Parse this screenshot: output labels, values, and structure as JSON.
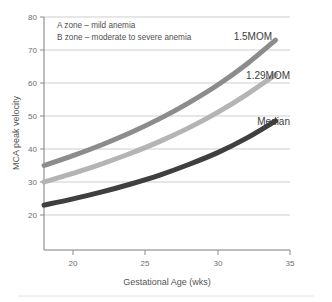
{
  "chart_data": {
    "type": "line",
    "title": "",
    "xlabel": "Gestational Age (wks)",
    "ylabel": "MCA peak velocity",
    "xlim": [
      18,
      35
    ],
    "ylim": [
      15,
      80
    ],
    "xticks": [
      20,
      25,
      30,
      35
    ],
    "yticks": [
      20,
      30,
      40,
      50,
      60,
      70,
      80
    ],
    "grid": true,
    "legend": "inline-right-labels",
    "x": [
      18,
      20,
      22,
      24,
      26,
      28,
      30,
      32,
      34
    ],
    "series": [
      {
        "name": "1.5MOM",
        "color": "#8c8c8c",
        "values": [
          35.0,
          38.0,
          41.3,
          45.0,
          49.2,
          54.0,
          59.4,
          65.7,
          73.0
        ]
      },
      {
        "name": "1.29MOM",
        "color": "#b4b4b4",
        "values": [
          30.0,
          32.6,
          35.5,
          38.7,
          42.3,
          46.4,
          51.1,
          56.5,
          62.5
        ]
      },
      {
        "name": "Median",
        "color": "#3f3f3f",
        "values": [
          23.0,
          24.9,
          27.0,
          29.4,
          32.1,
          35.3,
          38.9,
          43.3,
          48.5
        ]
      }
    ],
    "annotations": [
      "A zone – mild anemia",
      "B zone – moderate to severe anemia"
    ]
  },
  "axis": {
    "x_tick_labels": [
      "20",
      "25",
      "30",
      "35"
    ],
    "y_tick_labels": [
      "20",
      "30",
      "40",
      "50",
      "60",
      "70",
      "80"
    ]
  },
  "colors": {
    "grid": "#b9b9b9",
    "spine": "#7d7d7d",
    "text": "#4f4f4f",
    "background": "#ffffff"
  }
}
